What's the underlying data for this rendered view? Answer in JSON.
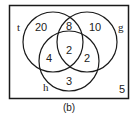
{
  "caption": "(b)",
  "colors": {
    "stroke": "#1a1a1a",
    "background": "#ffffff"
  },
  "sets": {
    "t": {
      "label": "t"
    },
    "g": {
      "label": "g"
    },
    "h": {
      "label": "h"
    }
  },
  "regions": {
    "t_only": "20",
    "t_g_only": "8",
    "g_only": "10",
    "t_h_only": "4",
    "t_g_h": "2",
    "g_h_only": "2",
    "h_only": "3",
    "outside": "5"
  }
}
